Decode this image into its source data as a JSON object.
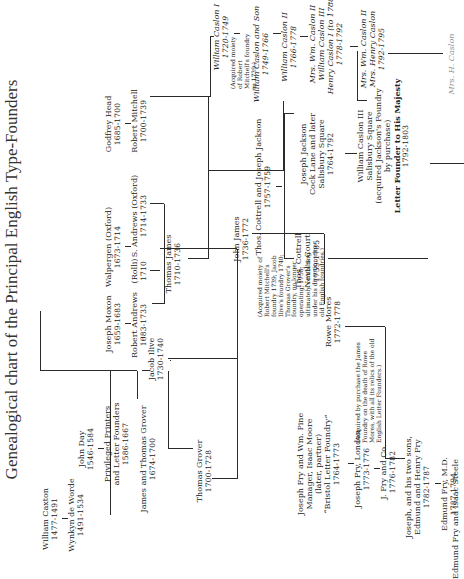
{
  "title": "Genealogical chart of the Principal English Type-Founders",
  "nodes": {
    "caxton": {
      "name": "William Caxton",
      "dates": "1477-1491"
    },
    "worde": {
      "name": "Wynkyn de Worde",
      "dates": "1491-1534"
    },
    "day": {
      "name": "John Day",
      "dates": "1546-1584"
    },
    "privileged": {
      "name": "Privileged Printers",
      "name2": "and Letter Founders",
      "dates": "1586-1667"
    },
    "grover": {
      "name": "James and Thomas Grover",
      "dates": "1674-1700"
    },
    "thomas_grover": {
      "name": "Thomas Grover",
      "dates": "1700-1728"
    },
    "ilive": {
      "name": "Jacob Ilive",
      "dates": "1730-1740"
    },
    "moxon": {
      "name": "Joseph Moxon",
      "dates": "1659-1683"
    },
    "andrews": {
      "name": "Robert Andrews",
      "dates": "1683-1733"
    },
    "rolli": {
      "name": "(Rolli)",
      "dates": "1710"
    },
    "walpergen": {
      "name": "Walpergen (Oxford)",
      "dates": "1673-1714"
    },
    "s_andrews": {
      "name": "S. Andrews (Oxford)",
      "dates": "1714-1733"
    },
    "thomas_james": {
      "name": "Thomas James",
      "dates": "1710-1736"
    },
    "head": {
      "name": "Godfrey Head",
      "dates": "1685-1700"
    },
    "mitchell": {
      "name": "Robert Mitchell",
      "dates": "1700-1739"
    },
    "john_james": {
      "name": "John James",
      "dates": "1736-1772"
    },
    "rowe_mores": {
      "name": "Rowe Mores",
      "dates": "1772-1778"
    },
    "cottrell_jackson": {
      "name": "Thos. Cottrell and Joseph Jackson",
      "dates": "1757-1759"
    },
    "cottrell": {
      "name": "Thos. Cottrell",
      "name2": "Nevil's Court",
      "dates": "1759-1785"
    },
    "jackson": {
      "name": "Joseph Jackson",
      "name2": "Cock Lane and later",
      "name3": "Salisbury Square",
      "dates": "1764-1792"
    },
    "caslon3": {
      "name": "William Caslon III",
      "name2": "Salisbury Square",
      "name3": "(acquired Jackson's Foundry",
      "name4": "by purchase)",
      "name5": "Letter Founder to His Majesty",
      "dates": "1792-1803"
    },
    "caslon1": {
      "name": "William Caslon I",
      "dates": "1720-1749"
    },
    "caslon_son": {
      "name": "William Caslon and Son",
      "dates": "1749-1766"
    },
    "caslon2": {
      "name": "William Caslon II",
      "dates": "1766-1778"
    },
    "mrs_caslon": {
      "name": "Mrs. Wm. Caslon II",
      "name2": "William Caslon III",
      "name3": "Henry Caslon I (to 1788)",
      "dates": "1778-1792"
    },
    "mrs_caslon2": {
      "name": "Mrs. Wm. Caslon II",
      "name2": "Mrs. Henry Caslon",
      "dates": "1792-1795"
    },
    "fry_pine": {
      "name": "Joseph Fry and Wm. Pine",
      "name2": "Manager, Isaac Moore",
      "name3": "(later, partner)",
      "name4": "“Bristol Letter Foundry”",
      "dates": "1764-1773"
    },
    "fry_london": {
      "name": "Joseph Fry, London",
      "dates": "1773-1776"
    },
    "j_fry": {
      "name": "J. Fry and Co.",
      "dates": "1776-1782"
    },
    "fry_sons": {
      "name": "Joseph, and his two sons,",
      "name2": "Edmund and Henry Fry",
      "dates": "1782-1787"
    },
    "edmund_fry": {
      "name": "Edmund Fry, M.D.",
      "dates": "1787-1794"
    },
    "fry_steele": {
      "name": "Edmund Fry and Isaac Steele"
    },
    "mrs_partial": {
      "name": "Mrs. H. Caslon"
    }
  },
  "notes": {
    "james_note": "(Acquired moiety of Robert Mitchell's foundry 1739; Jacob Ilive's foundry 1740; Thomas Grover's foundry, no longer operating, 1758; ultimately combining under his direction nine old English foundries.)",
    "caslon_note": "(Acquired moiety of Robert Mitchell's foundry in 1739.)",
    "mores_note": "(Acquired by purchase the James Foundry on the death of Rowe Mores, with all its relics of the old English Letter Founders.)"
  }
}
